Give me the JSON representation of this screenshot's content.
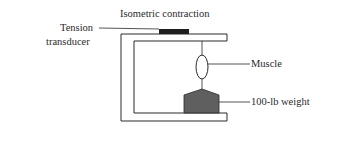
{
  "diagram": {
    "title": "Isometric contraction",
    "labels": {
      "transducer_line1": "Tension",
      "transducer_line2": "transducer",
      "muscle": "Muscle",
      "weight": "100-lb weight"
    },
    "colors": {
      "stroke": "#2a2a2a",
      "transducer_fill": "#1e1e1e",
      "weight_fill": "#5f5f5f",
      "background": "#ffffff"
    }
  }
}
